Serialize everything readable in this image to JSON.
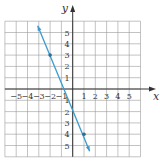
{
  "chart_data": {
    "type": "line",
    "title": "",
    "xlabel": "x",
    "ylabel": "y",
    "xlim": [
      -6,
      6
    ],
    "ylim": [
      -6,
      6
    ],
    "grid": true,
    "x_ticks": [
      "-5",
      "-4",
      "-3",
      "-2",
      "-1",
      "1",
      "2",
      "3",
      "4",
      "5"
    ],
    "y_ticks": [
      "5",
      "4",
      "3",
      "2",
      "1",
      "-1",
      "-2",
      "-3",
      "-4",
      "-5"
    ],
    "series": [
      {
        "name": "line",
        "color": "#3a9bd0",
        "points": [
          [
            -2,
            3
          ],
          [
            1,
            -4
          ]
        ],
        "slope": -2.333,
        "y_intercept": -1.667,
        "extends_from": [
          -3.1,
          5.6
        ],
        "extends_to": [
          1.5,
          -5.5
        ],
        "arrows_both_ends": true
      }
    ]
  },
  "labels": {
    "x_axis": "x",
    "y_axis": "y"
  },
  "colors": {
    "grid": "#9a9a9a",
    "axis": "#333333",
    "line": "#3a9bd0",
    "point": "#2a6f96"
  }
}
